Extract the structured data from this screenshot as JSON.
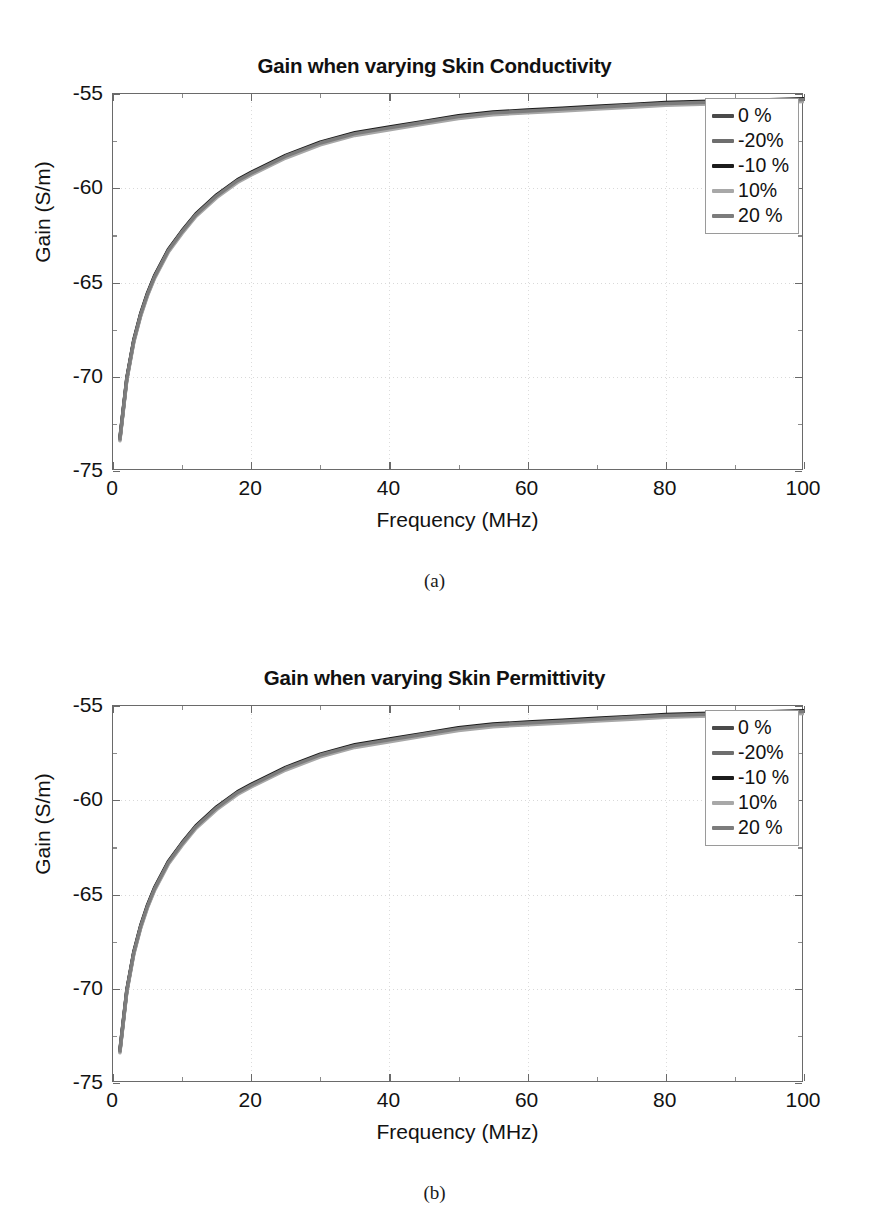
{
  "page": {
    "background": "#ffffff",
    "width": 869,
    "height": 1224
  },
  "figures": [
    {
      "id": "figure-a",
      "caption": "(a)",
      "chart_data": {
        "type": "line",
        "title": "Gain when varying Skin Conductivity",
        "xlabel": "Frequency (MHz)",
        "ylabel": "Gain (S/m)",
        "xlim": [
          0,
          100
        ],
        "ylim": [
          -75,
          -55
        ],
        "xticks": [
          0,
          20,
          40,
          60,
          80,
          100
        ],
        "yticks": [
          -55,
          -60,
          -65,
          -70,
          -75
        ],
        "xticklabels": [
          "0",
          "20",
          "40",
          "60",
          "80",
          "100"
        ],
        "yticklabels": [
          "-55",
          "-60",
          "-65",
          "-70",
          "-75"
        ],
        "grid": true,
        "legend_position": "upper right",
        "x": [
          1,
          2,
          3,
          4,
          5,
          6,
          8,
          10,
          12,
          15,
          18,
          20,
          25,
          30,
          35,
          40,
          45,
          50,
          55,
          60,
          65,
          70,
          75,
          80,
          85,
          90,
          95,
          100
        ],
        "series": [
          {
            "name": "0 %",
            "color": "#4a4a4a",
            "values": [
              -73.3,
              -70.1,
              -68.1,
              -66.7,
              -65.6,
              -64.7,
              -63.3,
              -62.3,
              -61.4,
              -60.4,
              -59.6,
              -59.2,
              -58.3,
              -57.6,
              -57.1,
              -56.8,
              -56.5,
              -56.2,
              -56.0,
              -55.9,
              -55.8,
              -55.7,
              -55.6,
              -55.5,
              -55.45,
              -55.4,
              -55.35,
              -55.3
            ]
          },
          {
            "name": "-20%",
            "color": "#6e6e6e",
            "values": [
              -73.35,
              -70.15,
              -68.15,
              -66.75,
              -65.65,
              -64.75,
              -63.35,
              -62.35,
              -61.45,
              -60.45,
              -59.65,
              -59.25,
              -58.35,
              -57.65,
              -57.15,
              -56.85,
              -56.55,
              -56.25,
              -56.05,
              -55.95,
              -55.85,
              -55.75,
              -55.65,
              -55.55,
              -55.5,
              -55.45,
              -55.4,
              -55.35
            ]
          },
          {
            "name": "-10 %",
            "color": "#1c1c1c",
            "values": [
              -73.25,
              -70.05,
              -68.05,
              -66.65,
              -65.55,
              -64.65,
              -63.25,
              -62.25,
              -61.35,
              -60.35,
              -59.55,
              -59.15,
              -58.25,
              -57.55,
              -57.05,
              -56.75,
              -56.45,
              -56.15,
              -55.95,
              -55.85,
              -55.75,
              -55.65,
              -55.55,
              -55.45,
              -55.4,
              -55.35,
              -55.3,
              -55.25
            ]
          },
          {
            "name": "10%",
            "color": "#a8a8a8",
            "values": [
              -73.4,
              -70.2,
              -68.2,
              -66.8,
              -65.7,
              -64.8,
              -63.4,
              -62.4,
              -61.5,
              -60.5,
              -59.7,
              -59.3,
              -58.4,
              -57.7,
              -57.2,
              -56.9,
              -56.6,
              -56.3,
              -56.1,
              -56.0,
              -55.9,
              -55.8,
              -55.7,
              -55.6,
              -55.55,
              -55.5,
              -55.45,
              -55.4
            ]
          },
          {
            "name": "20 %",
            "color": "#7c7c7c",
            "values": [
              -73.3,
              -70.1,
              -68.1,
              -66.7,
              -65.6,
              -64.7,
              -63.3,
              -62.3,
              -61.4,
              -60.4,
              -59.6,
              -59.2,
              -58.3,
              -57.6,
              -57.1,
              -56.8,
              -56.5,
              -56.2,
              -56.0,
              -55.9,
              -55.8,
              -55.7,
              -55.6,
              -55.5,
              -55.45,
              -55.4,
              -55.35,
              -55.3
            ]
          }
        ]
      }
    },
    {
      "id": "figure-b",
      "caption": "(b)",
      "chart_data": {
        "type": "line",
        "title": "Gain when varying Skin Permittivity",
        "xlabel": "Frequency (MHz)",
        "ylabel": "Gain (S/m)",
        "xlim": [
          0,
          100
        ],
        "ylim": [
          -75,
          -55
        ],
        "xticks": [
          0,
          20,
          40,
          60,
          80,
          100
        ],
        "yticks": [
          -55,
          -60,
          -65,
          -70,
          -75
        ],
        "xticklabels": [
          "0",
          "20",
          "40",
          "60",
          "80",
          "100"
        ],
        "yticklabels": [
          "-55",
          "-60",
          "-65",
          "-70",
          "-75"
        ],
        "grid": true,
        "legend_position": "upper right",
        "x": [
          1,
          2,
          3,
          4,
          5,
          6,
          8,
          10,
          12,
          15,
          18,
          20,
          25,
          30,
          35,
          40,
          45,
          50,
          55,
          60,
          65,
          70,
          75,
          80,
          85,
          90,
          95,
          100
        ],
        "series": [
          {
            "name": "0 %",
            "color": "#4a4a4a",
            "values": [
              -73.3,
              -70.1,
              -68.1,
              -66.7,
              -65.6,
              -64.7,
              -63.3,
              -62.3,
              -61.4,
              -60.4,
              -59.6,
              -59.2,
              -58.3,
              -57.6,
              -57.1,
              -56.8,
              -56.5,
              -56.2,
              -56.0,
              -55.9,
              -55.8,
              -55.7,
              -55.6,
              -55.5,
              -55.45,
              -55.4,
              -55.35,
              -55.3
            ]
          },
          {
            "name": "-20%",
            "color": "#6e6e6e",
            "values": [
              -73.35,
              -70.15,
              -68.15,
              -66.75,
              -65.65,
              -64.75,
              -63.35,
              -62.35,
              -61.45,
              -60.45,
              -59.65,
              -59.25,
              -58.35,
              -57.65,
              -57.15,
              -56.85,
              -56.55,
              -56.25,
              -56.05,
              -55.95,
              -55.85,
              -55.75,
              -55.65,
              -55.55,
              -55.5,
              -55.45,
              -55.4,
              -55.35
            ]
          },
          {
            "name": "-10 %",
            "color": "#1c1c1c",
            "values": [
              -73.25,
              -70.05,
              -68.05,
              -66.65,
              -65.55,
              -64.65,
              -63.25,
              -62.25,
              -61.35,
              -60.35,
              -59.55,
              -59.15,
              -58.25,
              -57.55,
              -57.05,
              -56.75,
              -56.45,
              -56.15,
              -55.95,
              -55.85,
              -55.75,
              -55.65,
              -55.55,
              -55.45,
              -55.4,
              -55.35,
              -55.3,
              -55.25
            ]
          },
          {
            "name": "10%",
            "color": "#a8a8a8",
            "values": [
              -73.4,
              -70.2,
              -68.2,
              -66.8,
              -65.7,
              -64.8,
              -63.4,
              -62.4,
              -61.5,
              -60.5,
              -59.7,
              -59.3,
              -58.4,
              -57.7,
              -57.2,
              -56.9,
              -56.6,
              -56.3,
              -56.1,
              -56.0,
              -55.9,
              -55.8,
              -55.7,
              -55.6,
              -55.55,
              -55.5,
              -55.45,
              -55.4
            ]
          },
          {
            "name": "20 %",
            "color": "#7c7c7c",
            "values": [
              -73.3,
              -70.1,
              -68.1,
              -66.7,
              -65.6,
              -64.7,
              -63.3,
              -62.3,
              -61.4,
              -60.4,
              -59.6,
              -59.2,
              -58.3,
              -57.6,
              -57.1,
              -56.8,
              -56.5,
              -56.2,
              -56.0,
              -55.9,
              -55.8,
              -55.7,
              -55.6,
              -55.5,
              -55.45,
              -55.4,
              -55.35,
              -55.3
            ]
          }
        ]
      }
    }
  ]
}
